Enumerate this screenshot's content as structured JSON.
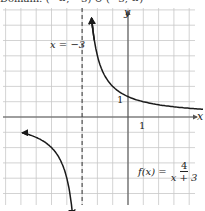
{
  "header": {
    "cut_text": "Domain: (−∞, −3) ∪ (−3, ∞)"
  },
  "chart_data": {
    "type": "line",
    "title": "",
    "function_label": "f(x) = 4/(x+3)",
    "function": {
      "lhs": "f(x) =",
      "numerator": "4",
      "denominator": "x + 3"
    },
    "xlabel": "x",
    "ylabel": "y",
    "asymptote": {
      "type": "vertical",
      "x": -3,
      "label": "x = −3",
      "style": "dashed"
    },
    "tick_labels": {
      "x_one": "1",
      "y_one": "1"
    },
    "grid": true,
    "xlim": [
      -8.2,
      5.1
    ],
    "ylim": [
      -6.2,
      7.1
    ],
    "series": [
      {
        "name": "right-branch",
        "x": [
          -2.75,
          -2.5,
          -2,
          -1,
          0,
          1,
          2,
          3,
          4,
          5
        ],
        "y": [
          16,
          8,
          4,
          2,
          1.33,
          1,
          0.8,
          0.67,
          0.57,
          0.5
        ]
      },
      {
        "name": "left-branch",
        "x": [
          -7,
          -6,
          -5,
          -4,
          -3.5,
          -3.25
        ],
        "y": [
          -1,
          -1.33,
          -2,
          -4,
          -8,
          -16
        ]
      }
    ]
  },
  "colors": {
    "grid": "#c8c8c8",
    "axis": "#555555",
    "curve": "#1a1a1a",
    "asymptote": "#333333"
  }
}
